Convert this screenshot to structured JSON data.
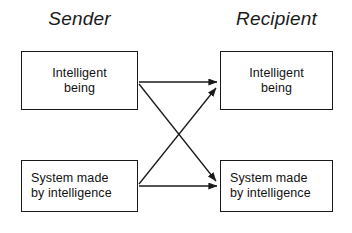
{
  "diagram": {
    "title_sender": "Sender",
    "title_recipient": "Recipient",
    "stroke_color": "#1a1a1a",
    "background_color": "#ffffff",
    "columns": [
      {
        "id": "sender",
        "label": "Sender",
        "nodes": [
          {
            "id": "sender-intelligent",
            "line1": "Intelligent",
            "line2": "being"
          },
          {
            "id": "sender-system",
            "line1": "System made",
            "line2": "by intelligence"
          }
        ]
      },
      {
        "id": "recipient",
        "label": "Recipient",
        "nodes": [
          {
            "id": "recipient-intelligent",
            "line1": "Intelligent",
            "line2": "being"
          },
          {
            "id": "recipient-system",
            "line1": "System made",
            "line2": "by intelligence"
          }
        ]
      }
    ],
    "arrows": [
      {
        "id": "intelligent-to-intelligent",
        "from": "sender-intelligent",
        "to": "recipient-intelligent"
      },
      {
        "id": "intelligent-to-system",
        "from": "sender-intelligent",
        "to": "recipient-system"
      },
      {
        "id": "system-to-intelligent",
        "from": "sender-system",
        "to": "recipient-intelligent"
      },
      {
        "id": "system-to-system",
        "from": "sender-system",
        "to": "recipient-system"
      }
    ]
  }
}
